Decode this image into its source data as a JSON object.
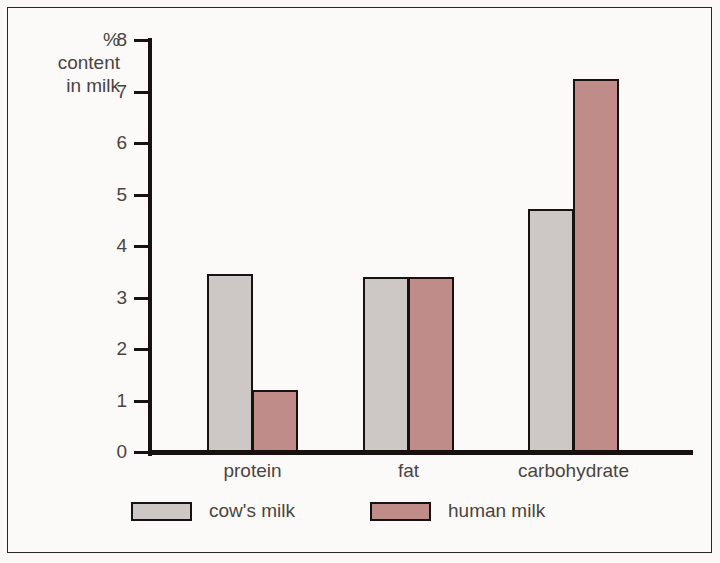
{
  "chart_data": {
    "type": "bar",
    "title": "",
    "subtitle": "",
    "xlabel": "",
    "ylabel": "% content in milk",
    "ylabel_lines": [
      "%",
      "content",
      "in milk"
    ],
    "categories": [
      "protein",
      "fat",
      "carbohydrate"
    ],
    "series": [
      {
        "name": "cow's milk",
        "values": [
          3.45,
          3.4,
          4.72
        ],
        "color": "#cdc7c5"
      },
      {
        "name": "human milk",
        "values": [
          1.2,
          3.4,
          7.25
        ],
        "color": "#c08c8a"
      }
    ],
    "ylim": [
      0,
      8
    ],
    "yticks": [
      0,
      1,
      2,
      3,
      4,
      5,
      6,
      7,
      8
    ],
    "ytick_labels": [
      "0",
      "1",
      "2",
      "3",
      "4",
      "5",
      "6",
      "7",
      "8"
    ],
    "grid": false,
    "legend_position": "bottom-left",
    "axis_color": "#17120f",
    "bar_outline_color": "#17120f",
    "background_color": "#fbf9f8",
    "frame_color": "#2b2523"
  },
  "legend": {
    "items": [
      {
        "label": "cow's milk",
        "color": "#cdc7c5"
      },
      {
        "label": "human milk",
        "color": "#c08c8a"
      }
    ]
  }
}
